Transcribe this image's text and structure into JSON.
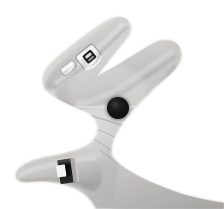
{
  "image": {
    "kind": "photograph",
    "subject": "human-hand-palm",
    "color_mode": "grayscale",
    "width": 224,
    "height": 209,
    "background_color": "#ffffff",
    "description": "Grayscale photo of an open left hand seen palm-up, two fingers extended toward upper left, thumb extended toward lower left, a dark round mark on the palm",
    "alt_text": "Palm of a hand with a dark round mole on the palm, a ring on the finger and a band on the thumb"
  },
  "skin": {
    "highlight": "#e6e4e2",
    "light": "#d2d0ce",
    "mid": "#b9b7b5",
    "shadow": "#9a9896",
    "deep_shadow": "#7e7c7a",
    "outline": "#8e8c8a"
  },
  "features": [
    {
      "name": "index-finger",
      "label": "Index finger",
      "cx": 70,
      "cy": 52,
      "note": "upper extended finger angled to upper-left"
    },
    {
      "name": "middle-finger",
      "label": "Middle finger",
      "cx": 82,
      "cy": 78,
      "note": "lower extended finger angled to upper-left"
    },
    {
      "name": "thumb",
      "label": "Thumb",
      "cx": 60,
      "cy": 172,
      "note": "extended toward lower-left"
    },
    {
      "name": "palm",
      "label": "Palm",
      "cx": 130,
      "cy": 120,
      "note": "central palm surface with creases"
    },
    {
      "name": "wrist",
      "label": "Wrist",
      "cx": 195,
      "cy": 180,
      "note": "lower-right, leaves frame"
    }
  ],
  "mark": {
    "name": "palm-mark",
    "label": "Dark round mark on palm",
    "shape": "circle",
    "center_x": 118,
    "center_y": 108,
    "radius": 11,
    "color": "#171717"
  },
  "jewelry": [
    {
      "name": "finger-ring",
      "label": "Ring with raised setting on index finger",
      "x": 78,
      "y": 46,
      "width": 22,
      "height": 22,
      "metal_color": "#f2f1ef",
      "stone_color": "#2a2a2a"
    },
    {
      "name": "thumb-band",
      "label": "Dark band on thumb",
      "x": 60,
      "y": 160,
      "width": 16,
      "height": 22,
      "band_color": "#1c1c1c",
      "clasp_color": "#f4f3f1"
    }
  ],
  "artifacts": {
    "scanline": {
      "name": "horizontal-scanline",
      "label": "Faint light horizontal scan line",
      "y": 107,
      "color": "#efeeec"
    }
  }
}
